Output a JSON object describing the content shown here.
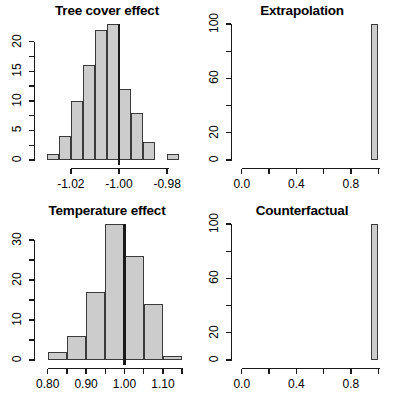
{
  "figure": {
    "layout": "2x2 panel of histograms",
    "background": "#ffffff",
    "bar_fill": "#cccccc",
    "bar_border": "#3a3a3a",
    "axis_color": "#1a1a1a"
  },
  "panels": [
    {
      "id": "tree-cover-effect",
      "title": "Tree cover effect",
      "y_ticks": [
        "0",
        "5",
        "10",
        "15",
        "20"
      ],
      "x_ticks": [
        "-1.02",
        "-1.00",
        "-0.98"
      ]
    },
    {
      "id": "extrapolation",
      "title": "Extrapolation",
      "y_ticks": [
        "0",
        "20",
        "60",
        "100"
      ],
      "x_ticks": [
        "0.0",
        "0.4",
        "0.8"
      ]
    },
    {
      "id": "temperature-effect",
      "title": "Temperature effect",
      "y_ticks": [
        "0",
        "10",
        "20",
        "30"
      ],
      "x_ticks": [
        "0.80",
        "0.90",
        "1.00",
        "1.10"
      ]
    },
    {
      "id": "counterfactual",
      "title": "Counterfactual",
      "y_ticks": [
        "0",
        "20",
        "60",
        "100"
      ],
      "x_ticks": [
        "0.0",
        "0.4",
        "0.8"
      ]
    }
  ],
  "chart_data": [
    {
      "type": "bar",
      "id": "tree-cover-effect",
      "title": "Tree cover effect",
      "xlabel": "",
      "ylabel": "",
      "bin_edges": [
        -1.03,
        -1.025,
        -1.02,
        -1.015,
        -1.01,
        -1.005,
        -1.0,
        -0.995,
        -0.99,
        -0.985,
        -0.98,
        -0.975
      ],
      "categories": [
        "-1.0275",
        "-1.0225",
        "-1.0175",
        "-1.0125",
        "-1.0075",
        "-1.0025",
        "-0.9975",
        "-0.9925",
        "-0.9875",
        "-0.9825",
        "-0.9775"
      ],
      "values": [
        1,
        4,
        10,
        16,
        22,
        23,
        12,
        8,
        3,
        0,
        1
      ],
      "xlim": [
        -1.032,
        -0.973
      ],
      "ylim": [
        0,
        23
      ],
      "x_tick_values": [
        -1.02,
        -1.0,
        -0.98
      ],
      "x_tick_labels": [
        "-1.02",
        "-1.00",
        "-0.98"
      ],
      "y_tick_values": [
        0,
        5,
        10,
        15,
        20
      ],
      "y_tick_labels": [
        "0",
        "5",
        "10",
        "15",
        "20"
      ],
      "y_minor_tick_values": [
        2.5,
        7.5,
        12.5,
        17.5
      ],
      "reference_line_x": -1.0,
      "grid": false,
      "legend": "none"
    },
    {
      "type": "bar",
      "id": "extrapolation",
      "title": "Extrapolation",
      "xlabel": "",
      "ylabel": "",
      "bin_edges": [
        0.95,
        1.0
      ],
      "categories": [
        "0.975"
      ],
      "values": [
        100
      ],
      "xlim": [
        -0.02,
        1.02
      ],
      "ylim": [
        0,
        100
      ],
      "x_tick_values": [
        0.0,
        0.2,
        0.4,
        0.6,
        0.8,
        1.0
      ],
      "x_tick_labels": [
        "0.0",
        "",
        "0.4",
        "",
        "0.8",
        ""
      ],
      "y_tick_values": [
        0,
        20,
        40,
        60,
        80,
        100
      ],
      "y_tick_labels": [
        "0",
        "20",
        "",
        "60",
        "",
        "100"
      ],
      "grid": false,
      "legend": "none"
    },
    {
      "type": "bar",
      "id": "temperature-effect",
      "title": "Temperature effect",
      "xlabel": "",
      "ylabel": "",
      "bin_edges": [
        0.8,
        0.85,
        0.9,
        0.95,
        1.0,
        1.05,
        1.1,
        1.15
      ],
      "categories": [
        "0.825",
        "0.875",
        "0.925",
        "0.975",
        "1.025",
        "1.075",
        "1.125"
      ],
      "values": [
        2,
        6,
        17,
        34,
        26,
        14,
        1
      ],
      "xlim": [
        0.785,
        1.155
      ],
      "ylim": [
        0,
        34
      ],
      "x_tick_values": [
        0.8,
        0.85,
        0.9,
        0.95,
        1.0,
        1.05,
        1.1,
        1.15
      ],
      "x_tick_labels": [
        "0.80",
        "",
        "0.90",
        "",
        "1.00",
        "",
        "1.10",
        ""
      ],
      "y_tick_values": [
        0,
        10,
        20,
        30
      ],
      "y_tick_labels": [
        "0",
        "10",
        "20",
        "30"
      ],
      "y_minor_tick_values": [
        5,
        15,
        25,
        35
      ],
      "reference_line_x": 1.0,
      "grid": false,
      "legend": "none"
    },
    {
      "type": "bar",
      "id": "counterfactual",
      "title": "Counterfactual",
      "xlabel": "",
      "ylabel": "",
      "bin_edges": [
        0.95,
        1.0
      ],
      "categories": [
        "0.975"
      ],
      "values": [
        100
      ],
      "xlim": [
        -0.02,
        1.02
      ],
      "ylim": [
        0,
        100
      ],
      "x_tick_values": [
        0.0,
        0.2,
        0.4,
        0.6,
        0.8,
        1.0
      ],
      "x_tick_labels": [
        "0.0",
        "",
        "0.4",
        "",
        "0.8",
        ""
      ],
      "y_tick_values": [
        0,
        20,
        40,
        60,
        80,
        100
      ],
      "y_tick_labels": [
        "0",
        "20",
        "",
        "60",
        "",
        "100"
      ],
      "grid": false,
      "legend": "none"
    }
  ]
}
